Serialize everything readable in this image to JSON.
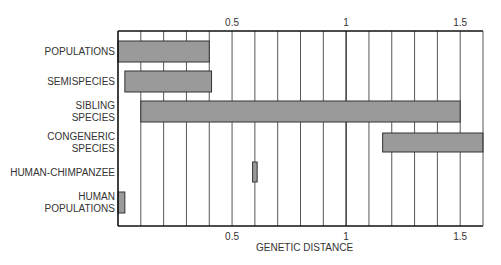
{
  "chart_data": {
    "type": "bar",
    "subtype": "floating-range-bar",
    "orientation": "horizontal",
    "title": "",
    "xlabel": "GENETIC DISTANCE",
    "ylabel": "",
    "xlim": [
      0,
      1.6
    ],
    "x_ticks": [
      0.5,
      1,
      1.5
    ],
    "x_tick_labels": [
      "0.5",
      "1",
      "1.5"
    ],
    "grid_step": 0.1,
    "grid": true,
    "categories": [
      "POPULATIONS",
      "SEMISPECIES",
      "SIBLING SPECIES",
      "CONGENERIC SPECIES",
      "HUMAN-CHIMPANZEE",
      "HUMAN POPULATIONS"
    ],
    "category_label_lines": [
      [
        "POPULATIONS"
      ],
      [
        "SEMISPECIES"
      ],
      [
        "SIBLING",
        "SPECIES"
      ],
      [
        "CONGENERIC",
        "SPECIES"
      ],
      [
        "HUMAN-CHIMPANZEE"
      ],
      [
        "HUMAN",
        "POPULATIONS"
      ]
    ],
    "ranges": [
      {
        "category": "POPULATIONS",
        "start": 0.0,
        "end": 0.4
      },
      {
        "category": "SEMISPECIES",
        "start": 0.03,
        "end": 0.41
      },
      {
        "category": "SIBLING SPECIES",
        "start": 0.1,
        "end": 1.5
      },
      {
        "category": "CONGENERIC SPECIES",
        "start": 1.16,
        "end": 1.6
      },
      {
        "category": "HUMAN-CHIMPANZEE",
        "start": 0.59,
        "end": 0.61
      },
      {
        "category": "HUMAN POPULATIONS",
        "start": 0.0,
        "end": 0.03
      }
    ],
    "legend": null
  },
  "colors": {
    "bar_fill": "#9a9a9a",
    "bar_stroke": "#333333",
    "grid": "#444444",
    "axis": "#111111",
    "text": "#333333"
  }
}
